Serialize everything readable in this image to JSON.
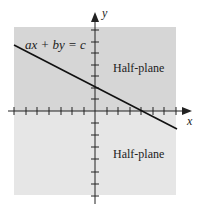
{
  "diagram": {
    "equation_label": "ax + by = c",
    "upper_region_label": "Half-plane",
    "lower_region_label": "Half-plane",
    "x_axis_label": "x",
    "y_axis_label": "y",
    "colors": {
      "upper_half_plane": "#d6d6d6",
      "lower_half_plane": "#e6e6e6",
      "line": "#111111",
      "axes": "#222222"
    }
  }
}
